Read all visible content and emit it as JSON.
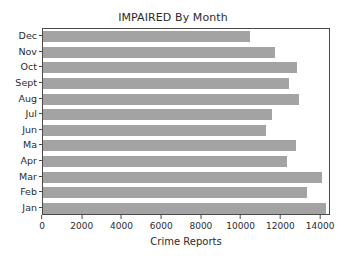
{
  "chart_data": {
    "type": "bar",
    "orientation": "horizontal",
    "title": "IMPAIRED By Month",
    "xlabel": "Crime Reports",
    "ylabel": "",
    "xlim": [
      0,
      14500
    ],
    "ylim": [
      0,
      12
    ],
    "grid": false,
    "legend": null,
    "bar_color": "#a3a3a3",
    "axis_color": "#4a4a4a",
    "background": "#ffffff",
    "xticks": [
      0,
      2000,
      4000,
      6000,
      8000,
      10000,
      12000,
      14000
    ],
    "xtick_labels": [
      "0",
      "2000",
      "4000",
      "6000",
      "8000",
      "10000",
      "12000",
      "14000"
    ],
    "categories": [
      "Jan",
      "Feb",
      "Mar",
      "Apr",
      "Ma",
      "Jun",
      "Jul",
      "Aug",
      "Sept",
      "Oct",
      "Nov",
      "Dec"
    ],
    "categories_top_to_bottom": [
      "Dec",
      "Nov",
      "Oct",
      "Sept",
      "Aug",
      "Jul",
      "Jun",
      "Ma",
      "Apr",
      "Mar",
      "Feb",
      "Jan"
    ],
    "values": [
      14250,
      13300,
      14050,
      12300,
      12750,
      11250,
      11550,
      12900,
      12400,
      12800,
      11700,
      10400
    ],
    "bars": [
      {
        "label": "Dec",
        "value": 10400
      },
      {
        "label": "Nov",
        "value": 11700
      },
      {
        "label": "Oct",
        "value": 12800
      },
      {
        "label": "Sept",
        "value": 12400
      },
      {
        "label": "Aug",
        "value": 12900
      },
      {
        "label": "Jul",
        "value": 11550
      },
      {
        "label": "Jun",
        "value": 11250
      },
      {
        "label": "Ma",
        "value": 12750
      },
      {
        "label": "Apr",
        "value": 12300
      },
      {
        "label": "Mar",
        "value": 14050
      },
      {
        "label": "Feb",
        "value": 13300
      },
      {
        "label": "Jan",
        "value": 14250
      }
    ]
  }
}
